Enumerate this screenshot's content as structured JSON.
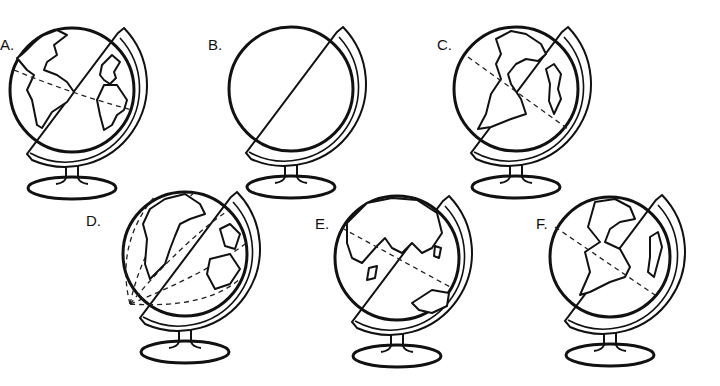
{
  "figure": {
    "globes": [
      {
        "label": "A.",
        "view": "Atlantic (Americas, Europe/Africa) with dashed equator"
      },
      {
        "label": "B.",
        "view": "blank globe"
      },
      {
        "label": "C.",
        "view": "Americas with dashed line"
      },
      {
        "label": "D.",
        "view": "Americas with dashed meridians"
      },
      {
        "label": "E.",
        "view": "Asia / Africa / Australia with dash-dot line"
      },
      {
        "label": "F.",
        "view": "Americas with dashed line"
      }
    ]
  }
}
